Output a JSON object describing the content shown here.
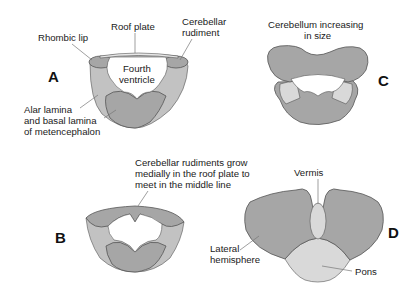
{
  "panels": {
    "A": {
      "letter": "A",
      "labels": {
        "rhombic_lip": "Rhombic lip",
        "roof_plate": "Roof plate",
        "cerebellar_rudiment_1": "Cerebellar",
        "cerebellar_rudiment_2": "rudiment",
        "fourth_ventricle_1": "Fourth",
        "fourth_ventricle_2": "ventricle",
        "alar_1": "Alar lamina",
        "alar_2": "and basal lamina",
        "alar_3": "of metencephalon"
      }
    },
    "B": {
      "letter": "B",
      "labels": {
        "caption_1": "Cerebellar rudiments grow",
        "caption_2": "medially in the roof plate to",
        "caption_3": "meet in the middle line"
      }
    },
    "C": {
      "letter": "C",
      "labels": {
        "caption_1": "Cerebellum increasing",
        "caption_2": "in size"
      }
    },
    "D": {
      "letter": "D",
      "labels": {
        "vermis": "Vermis",
        "lateral_1": "Lateral",
        "lateral_2": "hemisphere",
        "pons": "Pons"
      }
    }
  },
  "colors": {
    "dark_gray": "#a6a6a6",
    "mid_gray": "#c2c2c2",
    "light_gray": "#d9d9d9",
    "outline": "#555555"
  }
}
